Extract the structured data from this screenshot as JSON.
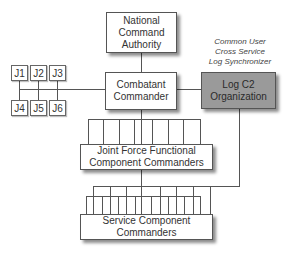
{
  "diagram": {
    "nodes": {
      "nca": {
        "label": "National\nCommand\nAuthority"
      },
      "combatant": {
        "label": "Combatant\nCommander"
      },
      "logc2": {
        "label": "Log C2\nOrganization",
        "fill": "#9a9a9a"
      },
      "jfcc": {
        "label": "Joint Force Functional\nComponent Commanders"
      },
      "scc": {
        "label": "Service Component\nCommanders"
      }
    },
    "staff": [
      "J1",
      "J2",
      "J3",
      "J4",
      "J5",
      "J6"
    ],
    "annotation": "Common User\nCross Service\nLog Synchronizer",
    "edges": [
      [
        "nca",
        "combatant"
      ],
      [
        "combatant",
        "staff"
      ],
      [
        "combatant",
        "logc2"
      ],
      [
        "combatant",
        "jfcc"
      ],
      [
        "jfcc",
        "scc"
      ],
      [
        "logc2",
        "scc"
      ]
    ],
    "colors": {
      "line": "#555555",
      "box_fill": "#ffffff",
      "log_fill": "#9a9a9a"
    }
  }
}
